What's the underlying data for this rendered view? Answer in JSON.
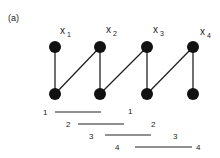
{
  "panel_label": "(a)",
  "colors": {
    "node": "#111111",
    "edge": "#222222",
    "text": "#222222",
    "background": "#ffffff"
  },
  "graph": {
    "vertices": [
      {
        "id": "x1",
        "label": "x",
        "sub": "1",
        "top": [
          55,
          47
        ],
        "bottom": [
          55,
          94
        ]
      },
      {
        "id": "x2",
        "label": "x",
        "sub": "2",
        "top": [
          100,
          47
        ],
        "bottom": [
          100,
          94
        ]
      },
      {
        "id": "x3",
        "label": "x",
        "sub": "3",
        "top": [
          147,
          47
        ],
        "bottom": [
          147,
          94
        ]
      },
      {
        "id": "x4",
        "label": "x",
        "sub": "4",
        "top": [
          193,
          47
        ],
        "bottom": [
          193,
          94
        ]
      }
    ],
    "edges": [
      {
        "from": "x1.top",
        "to": "x1.bottom"
      },
      {
        "from": "x1.bottom",
        "to": "x2.top"
      },
      {
        "from": "x2.top",
        "to": "x2.bottom"
      },
      {
        "from": "x2.bottom",
        "to": "x3.top"
      },
      {
        "from": "x3.top",
        "to": "x3.bottom"
      },
      {
        "from": "x3.bottom",
        "to": "x4.top"
      },
      {
        "from": "x4.top",
        "to": "x4.bottom"
      }
    ]
  },
  "intervals": [
    {
      "left_label": "1",
      "right_label": "1",
      "y": 112,
      "x1": 55,
      "x2": 101,
      "left_x": 45,
      "right_x": 130
    },
    {
      "left_label": "2",
      "right_label": "2",
      "y": 124,
      "x1": 78,
      "x2": 124,
      "left_x": 68,
      "right_x": 153
    },
    {
      "left_label": "3",
      "right_label": "3",
      "y": 135,
      "x1": 105,
      "x2": 151,
      "left_x": 91,
      "right_x": 175
    },
    {
      "left_label": "4",
      "right_label": "4",
      "y": 147,
      "x1": 135,
      "x2": 192,
      "left_x": 117,
      "right_x": 198
    }
  ]
}
